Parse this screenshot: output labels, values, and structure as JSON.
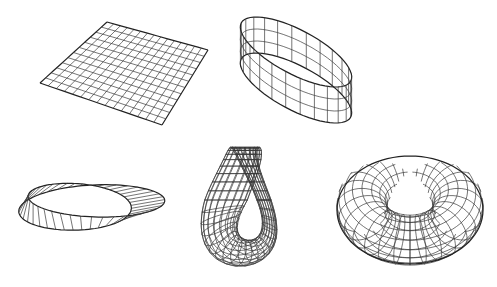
{
  "figure": {
    "width": 497,
    "height": 287,
    "background": "#ffffff",
    "stroke_color": "#333333",
    "surfaces": [
      {
        "id": "plane",
        "name": "flat plane",
        "corners": [
          [
            40,
            83
          ],
          [
            107,
            22
          ],
          [
            208,
            50
          ],
          [
            162,
            125
          ]
        ],
        "grid_u": 15,
        "grid_v": 12
      },
      {
        "id": "cylinder",
        "name": "cylinder band",
        "center": [
          296,
          70
        ],
        "rx": 62,
        "ry": 22,
        "rotation": 28,
        "height": 36,
        "meridians": 24,
        "rings": 3
      },
      {
        "id": "mobius",
        "name": "mobius strip",
        "bbox": [
          12,
          148,
          160,
          248
        ],
        "rulings": 40
      },
      {
        "id": "klein",
        "name": "klein bottle",
        "bbox": [
          170,
          148,
          310,
          272
        ]
      },
      {
        "id": "torus",
        "name": "torus",
        "center": [
          410,
          206
        ],
        "R": 48,
        "r": 25,
        "tilt": 0.78,
        "meridians": 28,
        "parallels": 16
      }
    ]
  }
}
